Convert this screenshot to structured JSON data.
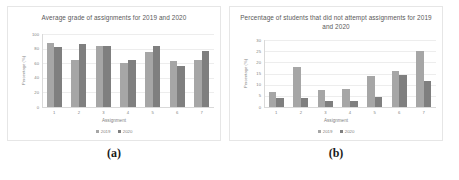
{
  "figure": {
    "panels": [
      {
        "caption": "(a)",
        "chart_data": {
          "type": "bar",
          "title": "Average grade of assignments for 2019 and 2020",
          "xlabel": "Assignment",
          "ylabel": "Percentage (%)",
          "categories": [
            "1",
            "2",
            "3",
            "4",
            "5",
            "6",
            "7"
          ],
          "yticks": [
            "0",
            "20",
            "40",
            "60",
            "80",
            "100"
          ],
          "ylim": [
            0,
            100
          ],
          "grid": true,
          "legend_position": "bottom",
          "series": [
            {
              "name": "2019",
              "color": "#a6a6a6",
              "values": [
                88,
                64,
                84,
                60,
                76,
                63,
                65
              ]
            },
            {
              "name": "2020",
              "color": "#7f7f7f",
              "values": [
                82,
                86,
                84,
                64,
                84,
                56,
                77
              ]
            }
          ]
        }
      },
      {
        "caption": "(b)",
        "chart_data": {
          "type": "bar",
          "title": "Percentage of students that did not attempt assignments for 2019 and 2020",
          "xlabel": "Assignment",
          "ylabel": "Percentage (%)",
          "categories": [
            "1",
            "2",
            "3",
            "4",
            "5",
            "6",
            "7"
          ],
          "yticks": [
            "0",
            "5",
            "10",
            "15",
            "20",
            "25",
            "30"
          ],
          "ylim": [
            0,
            30
          ],
          "grid": true,
          "legend_position": "bottom",
          "series": [
            {
              "name": "2019",
              "color": "#a6a6a6",
              "values": [
                6.5,
                18,
                7.5,
                8,
                14,
                16,
                25
              ]
            },
            {
              "name": "2020",
              "color": "#7f7f7f",
              "values": [
                4,
                4,
                2.5,
                2.5,
                4.5,
                14.5,
                11.5
              ]
            }
          ]
        }
      }
    ]
  }
}
